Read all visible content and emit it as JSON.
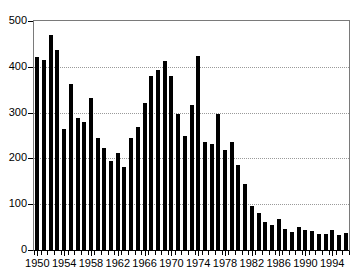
{
  "chart_data": {
    "type": "bar",
    "title": "",
    "subtitle": "",
    "xlabel": "",
    "ylabel": "",
    "xlim": [
      1949.5,
      1996.5
    ],
    "ylim": [
      0,
      500
    ],
    "grid": true,
    "legend": false,
    "bar_color": "#000000",
    "background_color": "#ffffff",
    "gridline_color": "#9a9a9a",
    "axis_color": "#000000",
    "y_ticks": [
      0,
      100,
      200,
      300,
      400,
      500
    ],
    "y_tick_labels": [
      "0",
      "100",
      "200",
      "300",
      "400",
      "500"
    ],
    "x_tick_labels": [
      "1950",
      "1954",
      "1958",
      "1962",
      "1966",
      "1970",
      "1974",
      "1978",
      "1982",
      "1986",
      "1990",
      "1994"
    ],
    "x_tick_values": [
      1950,
      1954,
      1958,
      1962,
      1966,
      1970,
      1974,
      1978,
      1982,
      1986,
      1990,
      1994
    ],
    "categories": [
      1950,
      1951,
      1952,
      1953,
      1954,
      1955,
      1956,
      1957,
      1958,
      1959,
      1960,
      1961,
      1962,
      1963,
      1964,
      1965,
      1966,
      1967,
      1968,
      1969,
      1970,
      1971,
      1972,
      1973,
      1974,
      1975,
      1976,
      1977,
      1978,
      1979,
      1980,
      1981,
      1982,
      1983,
      1984,
      1985,
      1986,
      1987,
      1988,
      1989,
      1990,
      1991,
      1992,
      1993,
      1994,
      1995,
      1996
    ],
    "values": [
      422,
      415,
      470,
      437,
      265,
      362,
      288,
      280,
      331,
      245,
      222,
      195,
      211,
      181,
      245,
      268,
      320,
      380,
      392,
      412,
      380,
      298,
      250,
      316,
      423,
      235,
      232,
      298,
      218,
      235,
      186,
      144,
      96,
      81,
      62,
      54,
      68,
      46,
      39,
      51,
      43,
      41,
      34,
      36,
      44,
      32,
      38
    ]
  }
}
